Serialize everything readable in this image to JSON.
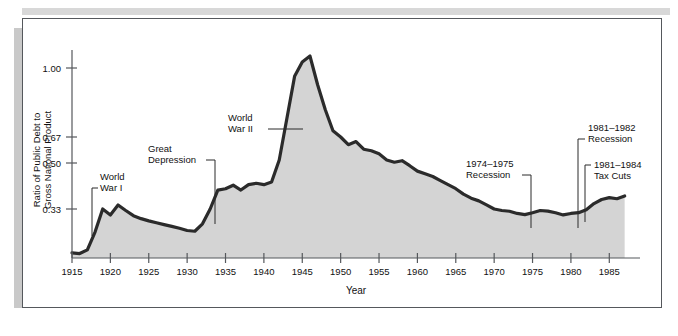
{
  "chart_data": {
    "type": "area",
    "title": "",
    "xlabel": "Year",
    "ylabel": "Ratio of Public Debt to Gross National Product",
    "ylabel_line1": "Ratio of Public Debt to",
    "ylabel_line2": "Gross National Product",
    "xlim": [
      1915,
      1989
    ],
    "ylim": [
      0,
      1.12
    ],
    "grid": false,
    "legend": "none",
    "y_scale_note": "nonlinear reciprocal-style spacing",
    "yticks": [
      1.0,
      0.67,
      0.5,
      0.33
    ],
    "ytick_labels": [
      "1.00",
      "0.67",
      "0.50",
      "0.33"
    ],
    "xticks": [
      1915,
      1920,
      1925,
      1930,
      1935,
      1940,
      1945,
      1950,
      1955,
      1960,
      1965,
      1970,
      1975,
      1980,
      1985
    ],
    "xtick_labels": [
      "1915",
      "1920",
      "1925",
      "1930",
      "1935",
      "1940",
      "1945",
      "1950",
      "1955",
      "1960",
      "1965",
      "1970",
      "1975",
      "1980",
      "1985"
    ],
    "series_name": "Ratio of Public Debt to GNP",
    "x": [
      1915,
      1916,
      1917,
      1918,
      1919,
      1920,
      1921,
      1922,
      1923,
      1924,
      1925,
      1926,
      1927,
      1928,
      1929,
      1930,
      1931,
      1932,
      1933,
      1934,
      1935,
      1936,
      1937,
      1938,
      1939,
      1940,
      1941,
      1942,
      1943,
      1944,
      1945,
      1946,
      1947,
      1948,
      1949,
      1950,
      1951,
      1952,
      1953,
      1954,
      1955,
      1956,
      1957,
      1958,
      1959,
      1960,
      1961,
      1962,
      1963,
      1964,
      1965,
      1966,
      1967,
      1968,
      1969,
      1970,
      1971,
      1972,
      1973,
      1974,
      1975,
      1976,
      1977,
      1978,
      1979,
      1980,
      1981,
      1982,
      1983,
      1984,
      1985,
      1986,
      1987
    ],
    "y": [
      0.035,
      0.03,
      0.055,
      0.175,
      0.33,
      0.29,
      0.345,
      0.32,
      0.285,
      0.265,
      0.25,
      0.237,
      0.225,
      0.213,
      0.2,
      0.185,
      0.18,
      0.23,
      0.33,
      0.4,
      0.405,
      0.418,
      0.4,
      0.42,
      0.425,
      0.42,
      0.43,
      0.52,
      0.76,
      0.96,
      1.04,
      1.08,
      0.92,
      0.8,
      0.7,
      0.67,
      0.62,
      0.64,
      0.59,
      0.58,
      0.56,
      0.52,
      0.505,
      0.515,
      0.49,
      0.47,
      0.46,
      0.45,
      0.435,
      0.42,
      0.405,
      0.385,
      0.37,
      0.36,
      0.345,
      0.33,
      0.32,
      0.315,
      0.3,
      0.292,
      0.305,
      0.32,
      0.316,
      0.305,
      0.29,
      0.3,
      0.305,
      0.325,
      0.35,
      0.365,
      0.372,
      0.368,
      0.378
    ],
    "colors": {
      "fill": "#d4d4d4",
      "line": "#2b2b2b",
      "axis": "#55585c",
      "text": "#111111",
      "frame": "#55585c"
    }
  },
  "annotations": [
    {
      "id": "world-war-i",
      "lines": [
        "World",
        "War I"
      ]
    },
    {
      "id": "great-depression",
      "lines": [
        "Great",
        "Depression"
      ]
    },
    {
      "id": "world-war-ii",
      "lines": [
        "World",
        "War II"
      ]
    },
    {
      "id": "recession-1974-1975",
      "lines": [
        "1974–1975",
        "Recession"
      ]
    },
    {
      "id": "recession-1981-1982",
      "lines": [
        "1981–1982",
        "Recession"
      ]
    },
    {
      "id": "tax-cuts-1981-1984",
      "lines": [
        "1981–1984",
        "Tax Cuts"
      ]
    }
  ]
}
